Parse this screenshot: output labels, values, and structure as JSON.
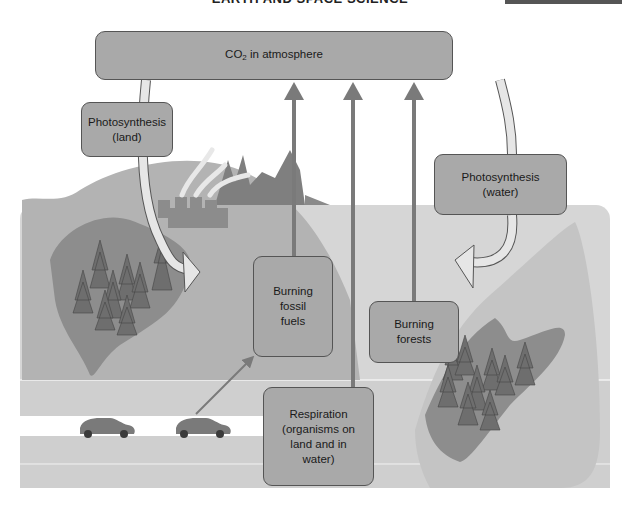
{
  "header": {
    "title": "EARTH AND SPACE SCIENCE"
  },
  "diagram": {
    "nodes": {
      "atmosphere": {
        "label_prefix": "CO",
        "label_sub": "2",
        "label_suffix": " in atmosphere"
      },
      "photosynthesis_land": {
        "line1": "Photosynthesis",
        "line2": "(land)"
      },
      "photosynthesis_water": {
        "line1": "Photosynthesis",
        "line2": "(water)"
      },
      "burning_fossil_fuels": {
        "line1": "Burning",
        "line2": "fossil",
        "line3": "fuels"
      },
      "burning_forests": {
        "line1": "Burning",
        "line2": "forests"
      },
      "respiration": {
        "line1": "Respiration",
        "line2": "(organisms on",
        "line3": "land and in",
        "line4": "water)"
      }
    },
    "edges": [
      {
        "from": "atmosphere",
        "to": "photosynthesis_land",
        "style": "curved-light-arrow"
      },
      {
        "from": "atmosphere",
        "to": "photosynthesis_water",
        "style": "curved-light-arrow"
      },
      {
        "from": "burning_fossil_fuels",
        "to": "atmosphere",
        "style": "dark-arrow"
      },
      {
        "from": "respiration",
        "to": "atmosphere",
        "style": "dark-arrow"
      },
      {
        "from": "burning_forests",
        "to": "atmosphere",
        "style": "dark-arrow"
      },
      {
        "from": "cars",
        "to": "burning_fossil_fuels",
        "style": "thin-arrow"
      }
    ],
    "illustrations": [
      "factory-with-smoke",
      "mountains",
      "forest-left",
      "forest-right",
      "road-with-cars",
      "water-body"
    ]
  },
  "colors": {
    "box_fill": "#a9a9a9",
    "box_border": "#555555",
    "arrow_dark": "#7a7a7a",
    "arrow_light": "#e6e6e6",
    "land": "#b4b4b4",
    "forest_patch": "#8f8f8f",
    "tree": "#6e6e6e",
    "water": "#d4d4d4",
    "road": "#ffffff"
  }
}
